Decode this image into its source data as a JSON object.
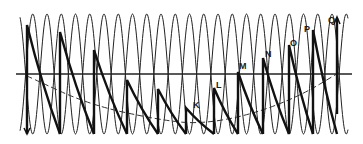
{
  "diagram": {
    "axis": {
      "x1": 16,
      "x2": 352,
      "y": 74
    },
    "wave": {
      "x_start": 20,
      "x_end": 348,
      "period": 28.5,
      "peak_y": 14,
      "trough_y": 134,
      "stroke": "#222222"
    },
    "dashed_curve": {
      "points": [
        [
          27,
          76
        ],
        [
          90,
          105
        ],
        [
          160,
          120
        ],
        [
          200,
          124
        ],
        [
          250,
          115
        ],
        [
          300,
          96
        ],
        [
          340,
          72
        ]
      ],
      "stroke": "#333333"
    },
    "strokes": [
      {
        "x": 27,
        "top": 25,
        "label": ""
      },
      {
        "x": 60,
        "top": 32,
        "label": ""
      },
      {
        "x": 94,
        "top": 50,
        "label": ""
      },
      {
        "x": 127,
        "top": 80,
        "label": ""
      },
      {
        "x": 158,
        "top": 89,
        "label": ""
      },
      {
        "x": 186,
        "top": 108,
        "label": "K"
      },
      {
        "x": 214,
        "top": 88,
        "label": "L"
      },
      {
        "x": 238,
        "top": 72,
        "label": "M"
      },
      {
        "x": 263,
        "top": 58,
        "label": "N"
      },
      {
        "x": 289,
        "top": 45,
        "label": "O"
      },
      {
        "x": 313,
        "top": 30,
        "label": "P"
      },
      {
        "x": 337,
        "top": 18,
        "label": "Q"
      }
    ],
    "labels": [
      {
        "text": "K",
        "x": 193,
        "y": 108
      },
      {
        "text": "L",
        "x": 216,
        "y": 88
      },
      {
        "text": "M",
        "x": 239,
        "y": 69
      },
      {
        "text": "N",
        "x": 265,
        "y": 57
      },
      {
        "text": "O",
        "x": 290,
        "y": 46
      },
      {
        "text": "P",
        "x": 304,
        "y": 32
      },
      {
        "text": "Q",
        "x": 328,
        "y": 23
      }
    ]
  }
}
